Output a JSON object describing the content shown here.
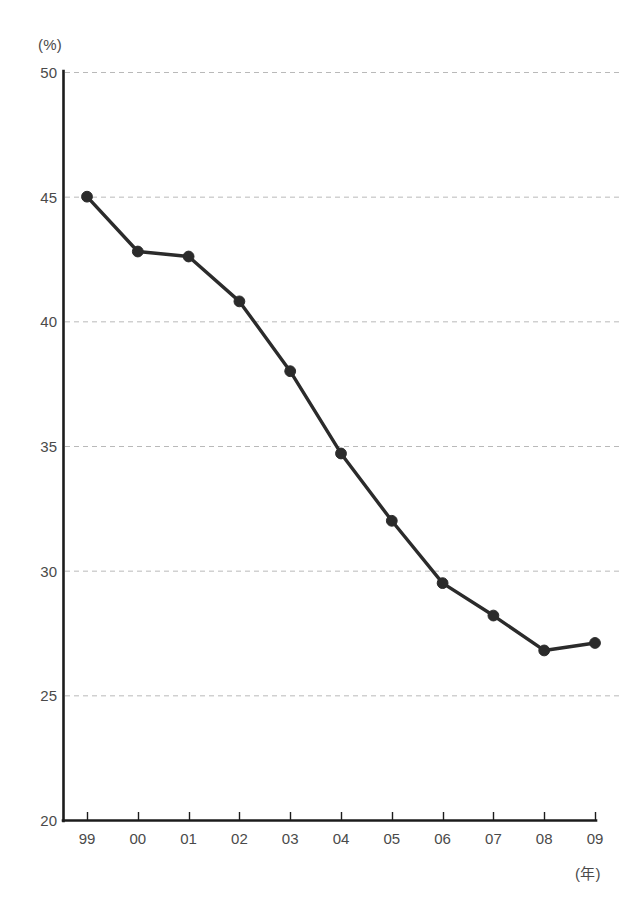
{
  "chart_data": {
    "type": "line",
    "title": "",
    "subtitle": "",
    "xlabel": "(年)",
    "ylabel": "(%)",
    "categories": [
      "99",
      "00",
      "01",
      "02",
      "03",
      "04",
      "05",
      "06",
      "07",
      "08",
      "09"
    ],
    "values": [
      45.0,
      42.8,
      42.6,
      40.8,
      38.0,
      34.7,
      32.0,
      29.5,
      28.2,
      26.8,
      27.1
    ],
    "series": [
      {
        "name": "",
        "values": [
          45.0,
          42.8,
          42.6,
          40.8,
          38.0,
          34.7,
          32.0,
          29.5,
          28.2,
          26.8,
          27.1
        ]
      }
    ],
    "ylim": [
      20,
      50
    ],
    "yticks": [
      20,
      25,
      30,
      35,
      40,
      45,
      50
    ],
    "ytick_labels": [
      "20",
      "25",
      "30",
      "35",
      "40",
      "45",
      "50"
    ],
    "xtick_labels": [
      "99",
      "00",
      "01",
      "02",
      "03",
      "04",
      "05",
      "06",
      "07",
      "08",
      "09"
    ],
    "grid": "horizontal-dashed",
    "legend": "none",
    "marker": "filled-circle",
    "line_color": "#2b2b2b",
    "marker_color": "#2b2b2b",
    "grid_color": "#b9b9b9",
    "axis_color": "#1c1c1c",
    "background_color": "#ffffff"
  },
  "axes": {
    "y_unit": "(%)",
    "x_unit": "(年)"
  }
}
